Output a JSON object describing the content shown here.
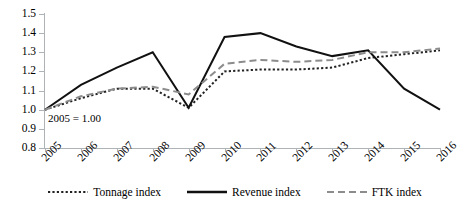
{
  "chart_data": {
    "type": "line",
    "title": "",
    "xlabel": "",
    "ylabel": "",
    "categories": [
      "2005",
      "2006",
      "2007",
      "2008",
      "2009",
      "2010",
      "2011",
      "2012",
      "2013",
      "2014",
      "2015",
      "2016"
    ],
    "ylim": [
      0.8,
      1.5
    ],
    "ytick_labels": [
      "1.5",
      "1.4",
      "1.3",
      "1.2",
      "1.1",
      "1.0",
      "0.9",
      "0.8"
    ],
    "ytick_values": [
      1.5,
      1.4,
      1.3,
      1.2,
      1.1,
      1.0,
      0.9,
      0.8
    ],
    "grid": false,
    "legend_position": "bottom",
    "annotations": [
      {
        "text": "2005 = 1.00",
        "x": "2005",
        "y": 1.0
      }
    ],
    "series": [
      {
        "name": "Tonnage index",
        "style": "dotted",
        "color": "#222222",
        "values": [
          1.0,
          1.06,
          1.11,
          1.11,
          1.01,
          1.2,
          1.21,
          1.21,
          1.22,
          1.27,
          1.29,
          1.31
        ]
      },
      {
        "name": "Revenue index",
        "style": "solid",
        "color": "#111111",
        "values": [
          1.0,
          1.13,
          1.22,
          1.3,
          1.01,
          1.38,
          1.4,
          1.33,
          1.28,
          1.31,
          1.11,
          1.0
        ]
      },
      {
        "name": "FTK index",
        "style": "dashed",
        "color": "#8c8c8c",
        "values": [
          1.0,
          1.07,
          1.11,
          1.12,
          1.08,
          1.24,
          1.26,
          1.25,
          1.26,
          1.3,
          1.3,
          1.32
        ]
      }
    ]
  },
  "legend": {
    "items": [
      {
        "label": "Tonnage index"
      },
      {
        "label": "Revenue index"
      },
      {
        "label": "FTK index"
      }
    ]
  },
  "axis": {
    "y_labels": [
      "1.5",
      "1.4",
      "1.3",
      "1.2",
      "1.1",
      "1.0",
      "0.9",
      "0.8"
    ],
    "x_labels": [
      "2005",
      "2006",
      "2007",
      "2008",
      "2009",
      "2010",
      "2011",
      "2012",
      "2013",
      "2014",
      "2015",
      "2016"
    ]
  },
  "annotation": {
    "baseline_note": "2005 = 1.00"
  }
}
